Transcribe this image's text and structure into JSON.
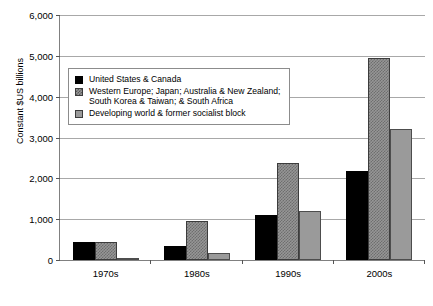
{
  "chart_data": {
    "type": "bar",
    "title": "",
    "xlabel": "",
    "ylabel": "Constant $US billions",
    "categories": [
      "1970s",
      "1980s",
      "1990s",
      "2000s"
    ],
    "ylim": [
      0,
      6000
    ],
    "ytick_labels": [
      "0",
      "1,000",
      "2,000",
      "3,000",
      "4,000",
      "5,000",
      "6,000"
    ],
    "ytick_values": [
      0,
      1000,
      2000,
      3000,
      4000,
      5000,
      6000
    ],
    "grid": true,
    "legend_position": "upper-left-inside",
    "series": [
      {
        "name": "United States &  Canada",
        "color": "#000000",
        "values": [
          430,
          340,
          1110,
          2180
        ]
      },
      {
        "name": "Western Europe; Japan; Australia & New Zealand;\nSouth Korea & Taiwan; & South Africa",
        "color": "#969696",
        "values": [
          450,
          960,
          2380,
          4950
        ]
      },
      {
        "name": "Developing world & former socialist block",
        "color": "#9a9a9a",
        "values": [
          40,
          160,
          1200,
          3200
        ]
      }
    ]
  }
}
